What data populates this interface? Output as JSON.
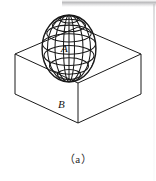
{
  "figure": {
    "caption": "（a）",
    "labels": {
      "sphere": "A",
      "box": "B"
    },
    "colors": {
      "ink": "#1a1a1a",
      "background": "#ffffff",
      "artifact_gray": "#a8a8aa"
    },
    "elements": {
      "sphere_name": "wireframe-sphere",
      "box_name": "isometric-open-box"
    }
  }
}
